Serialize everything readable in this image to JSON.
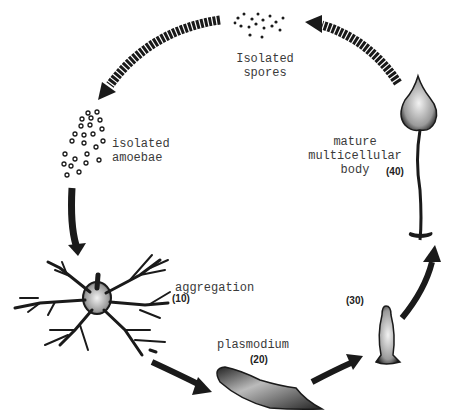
{
  "stages": {
    "spores": {
      "line1": "Isolated",
      "line2": "spores"
    },
    "amoebae": {
      "line1": "isolated",
      "line2": "amoebae"
    },
    "aggregation": {
      "label": "aggregation",
      "hours": "(10)"
    },
    "plasmodium": {
      "label": "plasmodium",
      "hours": "(20)"
    },
    "migration": {
      "hours": "(30)"
    },
    "mature": {
      "line1": "mature",
      "line2": "multicellular",
      "line3": "body",
      "hours": "(40)"
    }
  },
  "colors": {
    "ink": "#1a1a1a",
    "background": "#ffffff"
  }
}
